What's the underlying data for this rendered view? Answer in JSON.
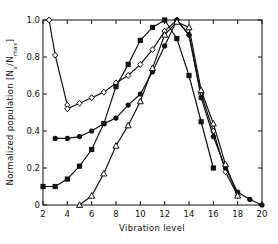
{
  "chart_data": {
    "type": "line",
    "title": "",
    "xlabel": "Vibration level",
    "ylabel": "Normalized population [N_v/N_max]",
    "ylabel_parts": {
      "main": "Normalized population [N",
      "sub1": "v",
      "mid": "/N",
      "sub2": "max",
      "end": "]"
    },
    "xlim": [
      2,
      20
    ],
    "ylim": [
      0,
      1.0
    ],
    "x_ticks": [
      2,
      4,
      6,
      8,
      10,
      12,
      14,
      16,
      18,
      20
    ],
    "y_ticks": [
      0,
      0.2,
      0.4,
      0.6,
      0.8,
      1.0
    ],
    "y_tick_labels": [
      "0",
      "0.2",
      "0.4",
      "0.6",
      "0.8",
      "1.0"
    ],
    "grid": false,
    "legend": null,
    "series": [
      {
        "name": "open circles / diamonds",
        "marker": "open-diamond",
        "x": [
          2.5,
          3,
          4,
          4,
          5,
          6,
          7,
          8,
          9,
          10,
          11,
          12,
          13,
          14,
          15,
          16,
          17,
          18
        ],
        "y": [
          1.0,
          0.81,
          0.54,
          0.52,
          0.55,
          0.58,
          0.61,
          0.66,
          0.7,
          0.76,
          0.84,
          0.94,
          1.0,
          0.92,
          0.6,
          0.4,
          0.18,
          0.05
        ]
      },
      {
        "name": "filled squares",
        "marker": "filled-square",
        "x": [
          2,
          3,
          4,
          5,
          6,
          7,
          8,
          9,
          10,
          11,
          12,
          13,
          14,
          15,
          16
        ],
        "y": [
          0.1,
          0.1,
          0.14,
          0.21,
          0.3,
          0.44,
          0.64,
          0.76,
          0.89,
          0.96,
          1.0,
          0.9,
          0.7,
          0.45,
          0.2
        ]
      },
      {
        "name": "filled circles",
        "marker": "filled-circle",
        "x": [
          3,
          4,
          5,
          6,
          7,
          8,
          9,
          10,
          11,
          12,
          13,
          14,
          15,
          16,
          17,
          18,
          19,
          20
        ],
        "y": [
          0.36,
          0.36,
          0.37,
          0.4,
          0.44,
          0.47,
          0.54,
          0.6,
          0.72,
          0.86,
          1.0,
          0.92,
          0.58,
          0.37,
          0.2,
          0.07,
          0.03,
          0.0
        ]
      },
      {
        "name": "open triangles",
        "marker": "open-triangle",
        "x": [
          5,
          6,
          7,
          8,
          9,
          10,
          11,
          12,
          13,
          14,
          15,
          16,
          17,
          18
        ],
        "y": [
          0.0,
          0.05,
          0.17,
          0.32,
          0.43,
          0.56,
          0.74,
          0.92,
          0.99,
          0.96,
          0.62,
          0.44,
          0.22,
          0.05
        ]
      }
    ]
  }
}
